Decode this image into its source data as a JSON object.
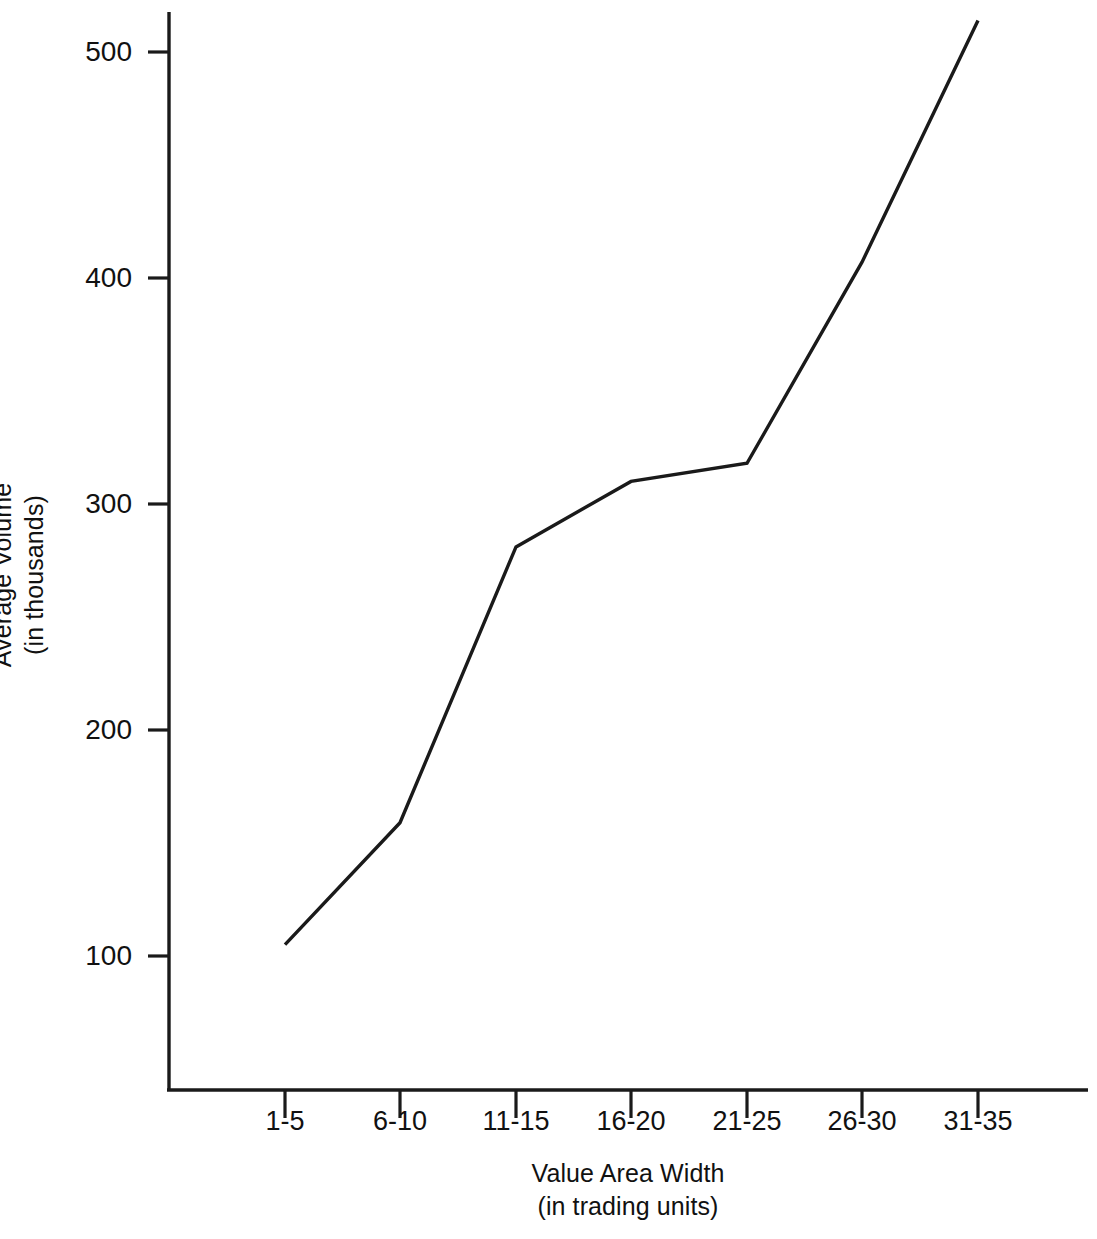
{
  "chart_data": {
    "type": "line",
    "title": "",
    "xlabel": "Value Area Width",
    "xlabel_sub": "(in trading units)",
    "ylabel": "Average Volume",
    "ylabel_sub": "(in thousands)",
    "categories": [
      "1-5",
      "6-10",
      "11-15",
      "16-20",
      "21-25",
      "26-30",
      "31-35"
    ],
    "values": [
      105,
      159,
      281,
      310,
      318,
      407,
      514
    ],
    "series": [
      {
        "name": "Average Volume",
        "values": [
          105,
          159,
          281,
          310,
          318,
          407,
          514
        ]
      }
    ],
    "yticks": [
      100,
      200,
      300,
      400,
      500
    ],
    "ytick_labels": [
      "100",
      "200",
      "300",
      "400",
      "500"
    ],
    "ylim": [
      47,
      520
    ],
    "grid": false,
    "legend": "none",
    "line_color": "#1a1a1a",
    "axis_color": "#1a1a1a"
  },
  "axes": {
    "y_title_line1": "Average Volume",
    "y_title_line2": "(in thousands)",
    "x_title_line1": "Value Area Width",
    "x_title_line2": "(in  trading  units)"
  }
}
